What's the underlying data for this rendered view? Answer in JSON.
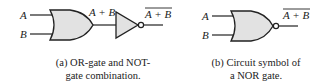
{
  "figure_a": {
    "input_a": "A",
    "input_b": "B",
    "or_output": "A + B",
    "final_output": "A + B",
    "final_output_overbar": true,
    "caption_line1": "(a) OR-gate and NOT-",
    "caption_line2": "gate combination."
  },
  "figure_b": {
    "input_a": "A",
    "input_b": "B",
    "output": "A + B",
    "output_overbar": true,
    "caption_line1": "(b) Circuit symbol of",
    "caption_line2": "a NOR gate."
  },
  "colors": {
    "gate_fill": "#e2e2e2",
    "stroke": "#222222"
  }
}
